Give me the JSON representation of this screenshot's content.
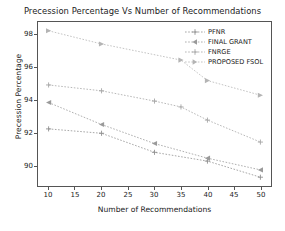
{
  "chart_data": {
    "type": "line",
    "title": "Precession Percentage Vs Number of Recommendations",
    "xlabel": "Number of Recommendations",
    "ylabel": "Precession Percentage",
    "xlim": [
      8,
      52
    ],
    "ylim": [
      88.2,
      99.4
    ],
    "xticks": [
      10,
      15,
      20,
      25,
      30,
      35,
      40,
      45,
      50
    ],
    "yticks": [
      90,
      92,
      94,
      96,
      98
    ],
    "grid": false,
    "legend_position": "upper right",
    "series": [
      {
        "name": "PFNR",
        "color": "#8f8f8f",
        "marker": "plus",
        "linestyle": "dotted",
        "x": [
          10,
          20,
          30,
          40,
          50
        ],
        "values": [
          92.1,
          91.8,
          90.5,
          89.9,
          88.8
        ]
      },
      {
        "name": "FINAL GRANT",
        "color": "#9a9a9a",
        "marker": "left-triangle",
        "linestyle": "dotted",
        "x": [
          10,
          20,
          30,
          40,
          50
        ],
        "values": [
          93.9,
          92.4,
          91.1,
          90.1,
          89.3
        ]
      },
      {
        "name": "FNRGE",
        "color": "#a5a5a5",
        "marker": "plus",
        "linestyle": "dotted",
        "x": [
          10,
          20,
          30,
          35,
          40,
          50
        ],
        "values": [
          95.1,
          94.7,
          94.0,
          93.6,
          92.7,
          91.2
        ]
      },
      {
        "name": "PROPOSED FSOL",
        "color": "#b4b4b4",
        "marker": "right-triangle",
        "linestyle": "dotted",
        "x": [
          10,
          20,
          35,
          40,
          50
        ],
        "values": [
          98.8,
          97.9,
          96.8,
          95.4,
          94.4
        ]
      }
    ]
  },
  "legend": {
    "entries": [
      {
        "label": "PFNR"
      },
      {
        "label": "FINAL GRANT"
      },
      {
        "label": "FNRGE"
      },
      {
        "label": "PROPOSED FSOL"
      }
    ]
  },
  "axes": {
    "y_tick_labels": [
      "98",
      "96",
      "94",
      "92",
      "90"
    ],
    "x_tick_labels": [
      "10",
      "15",
      "20",
      "25",
      "30",
      "35",
      "40",
      "45",
      "50"
    ]
  }
}
